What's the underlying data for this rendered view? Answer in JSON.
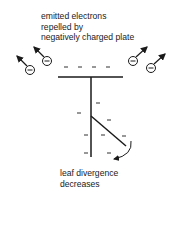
{
  "diagram": {
    "top_caption": {
      "lines": [
        "emitted electrons",
        "repelled by",
        "negatively charged plate"
      ]
    },
    "bottom_caption": {
      "lines": [
        "leaf divergence",
        "decreases"
      ]
    },
    "electron_symbol": "−",
    "charge_symbol": "–",
    "colors": {
      "ink": "#1a1a1a",
      "background": "#ffffff"
    }
  }
}
